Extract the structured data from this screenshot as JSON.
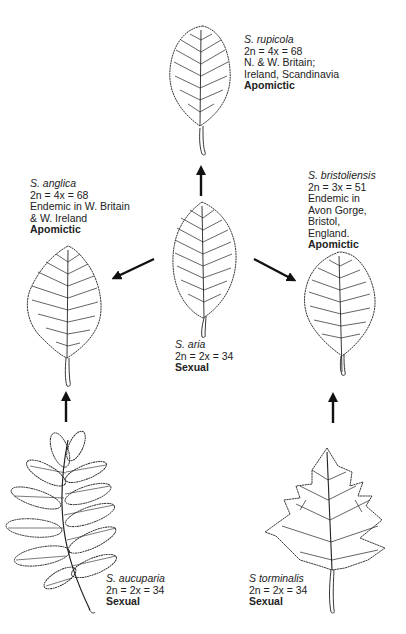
{
  "diagram": {
    "type": "evolutionary-relationship",
    "species": [
      {
        "id": "rupicola",
        "name": "S. rupicola",
        "chromosomes": "2n = 4x = 68",
        "distribution": [
          "N. & W. Britain;",
          "Ireland, Scandinavia"
        ],
        "reproduction": "Apomictic"
      },
      {
        "id": "anglica",
        "name": "S. anglica",
        "chromosomes": "2n = 4x = 68",
        "distribution": [
          "Endemic in W. Britain",
          "& W. Ireland"
        ],
        "reproduction": "Apomictic"
      },
      {
        "id": "bristoliensis",
        "name": "S. bristoliensis",
        "chromosomes": "2n = 3x = 51",
        "distribution": [
          "Endemic in",
          "Avon Gorge,",
          "Bristol,",
          "England."
        ],
        "reproduction": "Apomictic"
      },
      {
        "id": "aria",
        "name": "S. aria",
        "chromosomes": "2n = 2x = 34",
        "distribution": [],
        "reproduction": "Sexual"
      },
      {
        "id": "aucuparia",
        "name": "S. aucuparia",
        "chromosomes": "2n = 2x = 34",
        "distribution": [],
        "reproduction": "Sexual"
      },
      {
        "id": "torminalis",
        "name": "S torminalis",
        "chromosomes": "2n = 2x = 34",
        "distribution": [],
        "reproduction": "Sexual"
      }
    ],
    "arrows": [
      {
        "from": "aria",
        "to": "rupicola",
        "direction": "up"
      },
      {
        "from": "aria",
        "to": "anglica",
        "direction": "down-left"
      },
      {
        "from": "aria",
        "to": "bristoliensis",
        "direction": "down-right"
      },
      {
        "from": "aucuparia",
        "to": "anglica",
        "direction": "up"
      },
      {
        "from": "torminalis",
        "to": "bristoliensis",
        "direction": "up"
      }
    ],
    "colors": {
      "ink": "#1a1a1a",
      "background": "#ffffff"
    }
  }
}
